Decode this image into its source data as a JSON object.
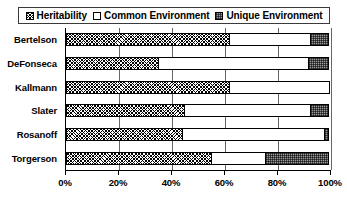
{
  "legend": {
    "position": "top",
    "entries": [
      {
        "label": "Heritability",
        "pattern": "diagonal-crosshatch",
        "swatch_name": "legend-swatch-heritability"
      },
      {
        "label": "Common Environment",
        "pattern": "white",
        "swatch_name": "legend-swatch-common-environment"
      },
      {
        "label": "Unique Environment",
        "pattern": "gray-dotted",
        "swatch_name": "legend-swatch-unique-environment"
      }
    ]
  },
  "chart_data": {
    "type": "bar",
    "orientation": "horizontal",
    "stacked": true,
    "stack_total": 100,
    "title": "",
    "subtitle": "",
    "xlabel": "",
    "ylabel": "",
    "xlim": [
      0,
      100
    ],
    "xticks": [
      0,
      20,
      40,
      60,
      80,
      100
    ],
    "xticklabels": [
      "0%",
      "20%",
      "40%",
      "60%",
      "80%",
      "100%"
    ],
    "grid": true,
    "grid_axis": "x",
    "legend_position": "top",
    "categories": [
      "Bertelson",
      "DeFonseca",
      "Kallmann",
      "Slater",
      "Rosanoff",
      "Torgerson"
    ],
    "series": [
      {
        "name": "Heritability",
        "values": [
          62,
          35,
          62,
          45,
          44,
          55
        ]
      },
      {
        "name": "Common Environment",
        "values": [
          31,
          57,
          38,
          48,
          54,
          21
        ]
      },
      {
        "name": "Unique Environment",
        "values": [
          7,
          8,
          0,
          7,
          2,
          24
        ]
      }
    ]
  }
}
